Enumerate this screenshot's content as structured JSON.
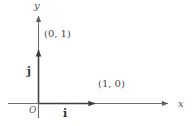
{
  "figure": {
    "kind": "coordinate-axes-diagram",
    "background_color": "#ffffff",
    "line_color": "#6b6b6b",
    "text_color": "#4a4a4a",
    "width": 193,
    "height": 126
  },
  "axes": {
    "x_axis_label": "x",
    "y_axis_label": "y",
    "origin_label": "O"
  },
  "vectors": [
    {
      "name": "i",
      "label": "i",
      "point_label": "(1, 0)",
      "direction": "horizontal-right"
    },
    {
      "name": "j",
      "label": "j",
      "point_label": "(0, 1)",
      "direction": "vertical-up"
    }
  ],
  "labels": {
    "point_1_0": "(1, 0)",
    "point_0_1": "(0, 1)",
    "vector_i": "i",
    "vector_j": "j"
  }
}
